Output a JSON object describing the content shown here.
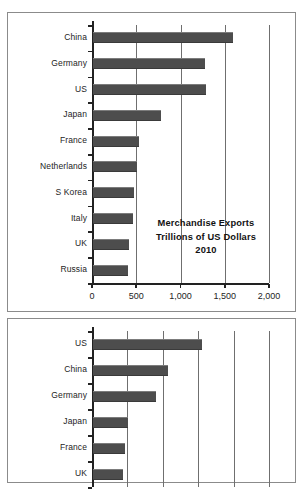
{
  "chart_data": [
    {
      "type": "bar",
      "orientation": "horizontal",
      "title": "Merchandise Exports",
      "subtitle": "Trillions of US Dollars",
      "year_label": "2010",
      "xlabel": "",
      "ylabel": "",
      "categories": [
        "China",
        "Germany",
        "US",
        "Japan",
        "France",
        "Netherlands",
        "S Korea",
        "Italy",
        "UK",
        "Russia"
      ],
      "values": [
        1578,
        1269,
        1278,
        770,
        521,
        492,
        466,
        448,
        406,
        392
      ],
      "xlim": [
        0,
        2000
      ],
      "xticks": [
        0,
        500,
        1000,
        1500,
        2000
      ],
      "xticklabels": [
        "0",
        "500",
        "1,000",
        "1,500",
        "2,000"
      ],
      "grid": true,
      "legend": false,
      "bar_color": "#4d4d4d"
    },
    {
      "type": "bar",
      "orientation": "horizontal",
      "title": "",
      "subtitle": "",
      "categories": [
        "US",
        "China",
        "Germany",
        "Japan",
        "France",
        "UK"
      ],
      "values": [
        1540,
        1055,
        890,
        500,
        445,
        420
      ],
      "xlim": [
        0,
        2500
      ],
      "xticks": [
        0,
        500,
        1000,
        1500,
        2000,
        2500
      ],
      "xticklabels": [
        "",
        "",
        "",
        "",
        "",
        ""
      ],
      "grid": true,
      "legend": false,
      "bar_color": "#4d4d4d",
      "note": "axis labels cropped off bottom of screenshot"
    }
  ],
  "charts": {
    "top": {
      "title_line1": "Merchandise Exports",
      "title_line2": "Trillions of US Dollars",
      "title_line3": "2010"
    }
  }
}
